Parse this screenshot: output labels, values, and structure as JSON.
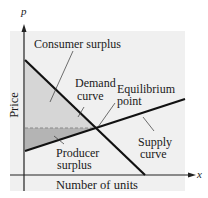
{
  "diagram": {
    "axes": {
      "y_variable": "p",
      "x_variable": "x",
      "y_label": "Price",
      "x_label": "Number of units"
    },
    "labels": {
      "consumer_surplus": "Consumer surplus",
      "demand_curve_line1": "Demand",
      "demand_curve_line2": "curve",
      "equilibrium_line1": "Equilibrium",
      "equilibrium_line2": "point",
      "supply_curve_line1": "Supply",
      "supply_curve_line2": "curve",
      "producer_surplus_line1": "Producer",
      "producer_surplus_line2": "surplus"
    },
    "colors": {
      "background_panel": "#f0f0f0",
      "consumer_surplus_fill": "#d6d6d6",
      "producer_surplus_fill": "#b4b4b4",
      "curve_stroke": "#111111",
      "axis_stroke": "#222222",
      "dashed_line": "#8a8a8a"
    },
    "geometry": {
      "demand_curve": {
        "start": [
          25,
          60
        ],
        "end": [
          145,
          175
        ]
      },
      "supply_curve": {
        "start": [
          25,
          151
        ],
        "end": [
          185,
          99
        ]
      },
      "equilibrium_point": [
        95,
        128
      ]
    }
  }
}
